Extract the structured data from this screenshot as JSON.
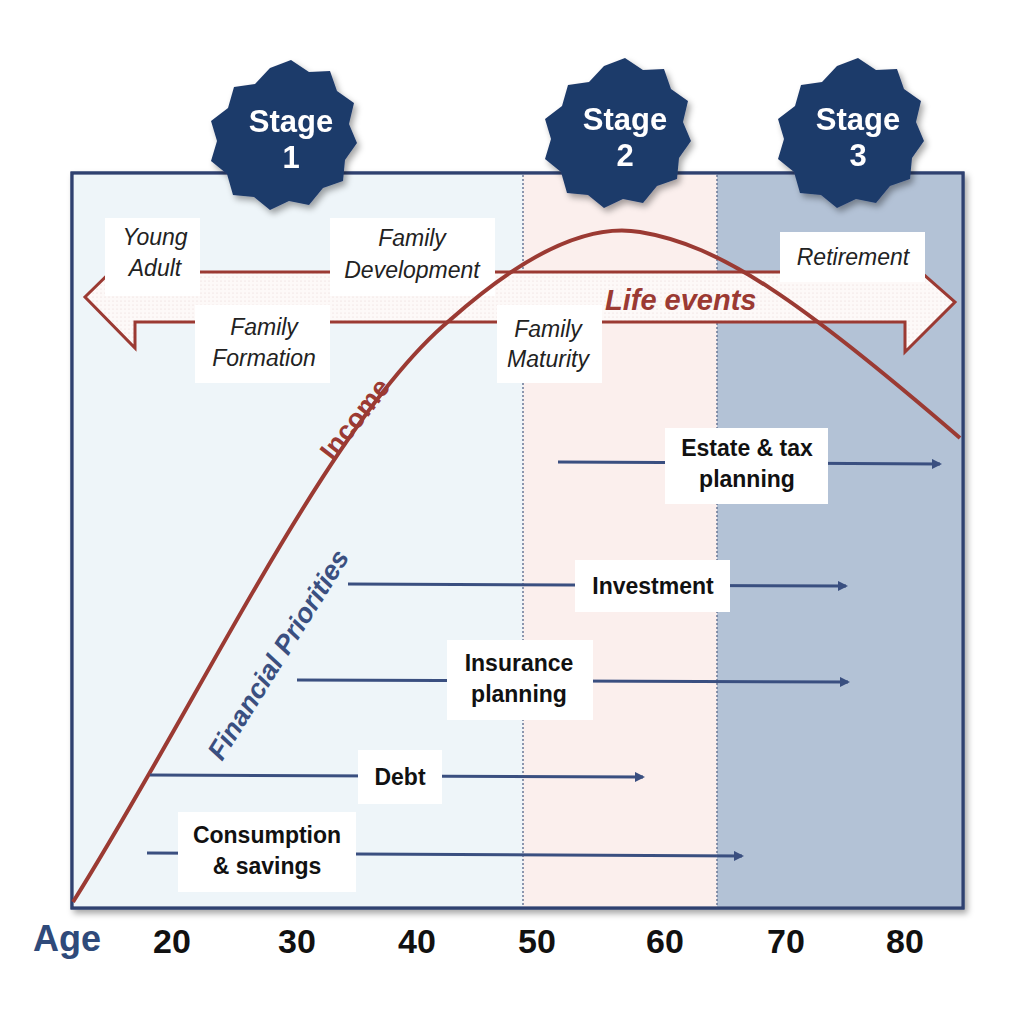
{
  "stages": [
    {
      "title": "Stage",
      "number": "1"
    },
    {
      "title": "Stage",
      "number": "2"
    },
    {
      "title": "Stage",
      "number": "3"
    }
  ],
  "life_events": {
    "arrow_label": "Life events",
    "items": [
      {
        "line1": "Young",
        "line2": "Adult"
      },
      {
        "line1": "Family",
        "line2": "Development"
      },
      {
        "line1": "Family",
        "line2": "Formation"
      },
      {
        "line1": "Family",
        "line2": "Maturity"
      },
      {
        "line1": "Retirement",
        "line2": ""
      }
    ]
  },
  "curves": {
    "income_label": "Income",
    "priorities_label": "Financial Priorities"
  },
  "priorities": [
    {
      "line1": "Estate & tax",
      "line2": "planning"
    },
    {
      "line1": "Investment",
      "line2": ""
    },
    {
      "line1": "Insurance",
      "line2": "planning"
    },
    {
      "line1": "Debt",
      "line2": ""
    },
    {
      "line1": "Consumption",
      "line2": "& savings"
    }
  ],
  "axis": {
    "title": "Age",
    "ticks": [
      "20",
      "30",
      "40",
      "50",
      "60",
      "70",
      "80"
    ]
  },
  "colors": {
    "stage_badge": "#1f3a6b",
    "panel_stage1": "#eef5f9",
    "panel_stage2": "#fbefed",
    "panel_stage3": "#b3c2d6",
    "income_curve": "#9b3a33",
    "priority_arrows": "#3a4f80",
    "border": "#2f4170"
  }
}
